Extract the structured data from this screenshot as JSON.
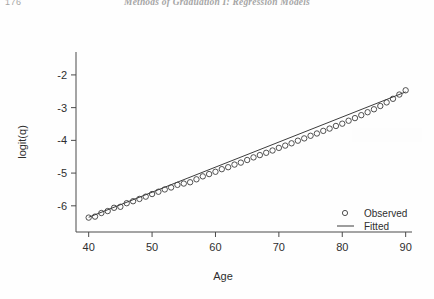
{
  "page": {
    "folio": "176",
    "running_head": "Methods of Graduation I: Regression Models"
  },
  "chart_data": {
    "type": "scatter",
    "title": "",
    "xlabel": "Age",
    "ylabel": "logit(q)",
    "xlim": [
      38,
      91
    ],
    "ylim": [
      -6.8,
      -1.3
    ],
    "xticks": [
      "40",
      "50",
      "60",
      "70",
      "80",
      "90"
    ],
    "xtick_values": [
      40,
      50,
      60,
      70,
      80,
      90
    ],
    "yticks": [
      "-2",
      "-3",
      "-4",
      "-5",
      "-6"
    ],
    "ytick_values": [
      -2,
      -3,
      -4,
      -5,
      -6
    ],
    "grid": false,
    "legend_position": "bottom-right",
    "legend": [
      {
        "label": "Observed",
        "marker": "open-circle"
      },
      {
        "label": "Fitted",
        "marker": "line"
      }
    ],
    "series": [
      {
        "name": "Observed",
        "marker": "open-circle",
        "x": [
          40,
          41,
          42,
          43,
          44,
          45,
          46,
          47,
          48,
          49,
          50,
          51,
          52,
          53,
          54,
          55,
          56,
          57,
          58,
          59,
          60,
          61,
          62,
          63,
          64,
          65,
          66,
          67,
          68,
          69,
          70,
          71,
          72,
          73,
          74,
          75,
          76,
          77,
          78,
          79,
          80,
          81,
          82,
          83,
          84,
          85,
          86,
          87,
          88,
          89,
          90
        ],
        "y": [
          -6.36,
          -6.33,
          -6.22,
          -6.16,
          -6.06,
          -6.03,
          -5.92,
          -5.86,
          -5.79,
          -5.72,
          -5.64,
          -5.57,
          -5.5,
          -5.44,
          -5.36,
          -5.32,
          -5.28,
          -5.19,
          -5.1,
          -5.03,
          -4.96,
          -4.88,
          -4.82,
          -4.74,
          -4.68,
          -4.6,
          -4.52,
          -4.45,
          -4.38,
          -4.31,
          -4.23,
          -4.16,
          -4.09,
          -4.01,
          -3.94,
          -3.86,
          -3.79,
          -3.71,
          -3.64,
          -3.56,
          -3.49,
          -3.4,
          -3.32,
          -3.23,
          -3.14,
          -3.05,
          -2.95,
          -2.84,
          -2.73,
          -2.6,
          -2.47
        ]
      },
      {
        "name": "Fitted",
        "marker": "line",
        "x": [
          40,
          90
        ],
        "y": [
          -6.35,
          -2.52
        ]
      }
    ]
  }
}
